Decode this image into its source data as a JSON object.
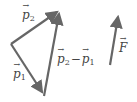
{
  "diagram": {
    "colors": {
      "stroke": "#666666",
      "text": "#444444",
      "background": "#ffffff"
    },
    "vectors": [
      {
        "id": "p1",
        "label": "p",
        "sub": "1",
        "from": [
          11,
          44
        ],
        "to": [
          44,
          96
        ]
      },
      {
        "id": "p2",
        "label": "p",
        "sub": "2",
        "from": [
          11,
          44
        ],
        "to": [
          60,
          10
        ]
      },
      {
        "id": "p2_minus_p1",
        "from": [
          44,
          96
        ],
        "to": [
          60,
          10
        ]
      },
      {
        "id": "F",
        "label": "F",
        "from": [
          110,
          65
        ],
        "to": [
          119,
          14
        ]
      }
    ],
    "labels": {
      "p2": {
        "base": "p",
        "sub": "2"
      },
      "p1": {
        "base": "p",
        "sub": "1"
      },
      "diff": {
        "a": "p",
        "a_sub": "2",
        "op": "−",
        "b": "p",
        "b_sub": "1"
      },
      "F": {
        "base": "F"
      }
    }
  }
}
